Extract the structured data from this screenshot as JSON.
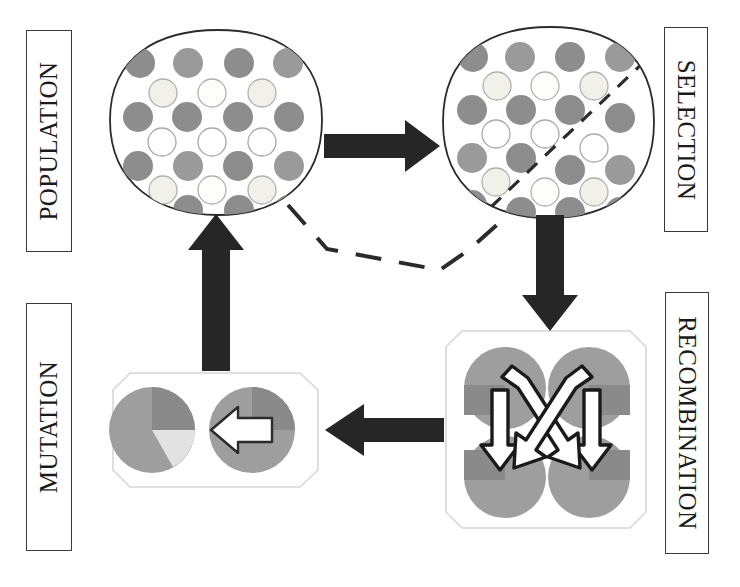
{
  "diagram": {
    "artifact_top_text": "",
    "labels": {
      "population": "POPULATION",
      "selection": "SELECTION",
      "mutation": "MUTATION",
      "recombination": "RECOMBINATION"
    },
    "colors": {
      "outline": "#2b2b2b",
      "arrow_fill": "#262626",
      "dark_circle": "#8d8d8d",
      "mid_circle": "#9a9a9a",
      "light_circle": "#f3f3ef",
      "light_circle_stroke": "#a8a8a8",
      "pie_base": "#9e9e9e",
      "pie_wedge_dark": "#8a8a8a",
      "pie_wedge_light": "#dedede",
      "box_faint_outline": "#d6d6d6",
      "white": "#ffffff",
      "background": "#ffffff"
    },
    "nodes": [
      {
        "id": "population",
        "shape": "rounded-blob",
        "label": "POPULATION",
        "circle_count": 24
      },
      {
        "id": "selection",
        "shape": "rounded-blob",
        "label": "SELECTION",
        "circle_count": 24,
        "divider": "dashed-diagonal"
      },
      {
        "id": "recombination",
        "shape": "octagon",
        "label": "RECOMBINATION",
        "circle_count": 4,
        "arrow_count": 4
      },
      {
        "id": "mutation",
        "shape": "octagon",
        "label": "MUTATION",
        "circle_count": 2,
        "arrow_count": 1
      }
    ],
    "edges": [
      {
        "id": "population-to-selection",
        "from": "population",
        "to": "selection",
        "style": "solid",
        "direction": "right"
      },
      {
        "id": "selection-to-recombination",
        "from": "selection",
        "to": "recombination",
        "style": "solid",
        "direction": "down"
      },
      {
        "id": "recombination-to-mutation",
        "from": "recombination",
        "to": "mutation",
        "style": "solid",
        "direction": "left"
      },
      {
        "id": "mutation-to-population",
        "from": "mutation",
        "to": "population",
        "style": "solid",
        "direction": "up"
      },
      {
        "id": "population-selection-link",
        "from": "population",
        "to": "selection",
        "style": "dashed",
        "direction": "none"
      }
    ]
  }
}
